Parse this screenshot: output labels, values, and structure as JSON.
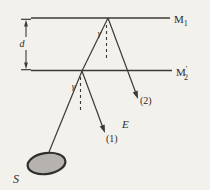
{
  "figure": {
    "bg_color": "#f3f1ec",
    "ink_color": "#3a3a38",
    "source_fill": "#b6b3ae",
    "labels": {
      "m1": {
        "base": "M",
        "sub": "1"
      },
      "m2": {
        "base": "M",
        "prime": "′",
        "sub": "2"
      },
      "d": "d",
      "gamma_top": "γ",
      "gamma_bottom": "γ",
      "E": "E",
      "ray1": "(1)",
      "ray2": "(2)",
      "S": "S"
    }
  }
}
